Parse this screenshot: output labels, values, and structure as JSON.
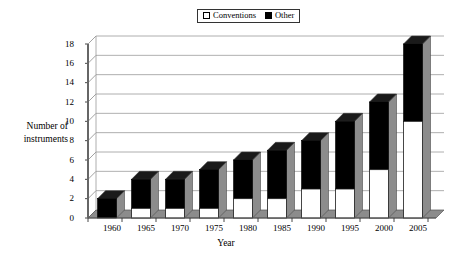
{
  "legend": {
    "position": "top-center",
    "entries": [
      {
        "label": "Conventions",
        "color": "#ffffff",
        "icon": "white-square-icon"
      },
      {
        "label": "Other",
        "color": "#000000",
        "icon": "black-square-icon"
      }
    ]
  },
  "axes": {
    "ylabel_line1": "Number of",
    "ylabel_line2": "instruments",
    "xlabel": "Year",
    "yticks": [
      "0",
      "2",
      "4",
      "6",
      "8",
      "10",
      "12",
      "14",
      "16",
      "18"
    ],
    "xticks": [
      "1960",
      "1965",
      "1970",
      "1975",
      "1980",
      "1985",
      "1990",
      "1995",
      "2000",
      "2005"
    ]
  },
  "chart_data": {
    "type": "bar",
    "stacked": true,
    "title": "",
    "xlabel": "Year",
    "ylabel": "Number of instruments",
    "categories": [
      "1960",
      "1965",
      "1970",
      "1975",
      "1980",
      "1985",
      "1990",
      "1995",
      "2000",
      "2005"
    ],
    "series": [
      {
        "name": "Conventions",
        "color": "#ffffff",
        "values": [
          0,
          1,
          1,
          1,
          2,
          2,
          3,
          3,
          5,
          10
        ]
      },
      {
        "name": "Other",
        "color": "#000000",
        "values": [
          2,
          3,
          3,
          4,
          4,
          5,
          5,
          7,
          7,
          8
        ]
      }
    ],
    "totals": [
      2,
      4,
      4,
      5,
      6,
      7,
      8,
      10,
      12,
      18
    ],
    "ylim": [
      0,
      18
    ],
    "ytick_step": 2,
    "grid": true,
    "grid_axis": "y",
    "legend_position": "top-center",
    "style": "3d-perspective"
  }
}
